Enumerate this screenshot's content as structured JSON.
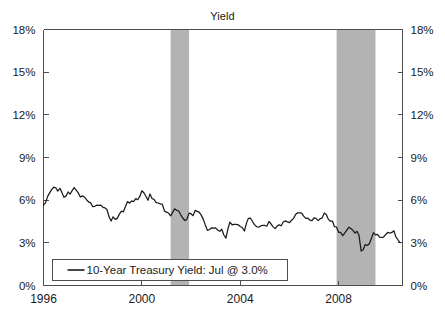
{
  "chart_data": {
    "type": "line",
    "title": "Yield",
    "xlabel": "",
    "ylabel": "",
    "ylim": [
      0,
      18
    ],
    "xlim": [
      1996.0,
      2010.6
    ],
    "y_ticks": [
      0,
      3,
      6,
      9,
      12,
      15,
      18
    ],
    "y_tick_labels": [
      "0%",
      "3%",
      "6%",
      "9%",
      "12%",
      "15%",
      "18%"
    ],
    "x_ticks": [
      1996,
      2000,
      2004,
      2008
    ],
    "x_tick_labels": [
      "1996",
      "2000",
      "2004",
      "2008"
    ],
    "grid": false,
    "dual_axis": true,
    "legend_position": "inside-bottom-left",
    "legend": [
      {
        "label": "10-Year Treasury Yield: Jul @ 3.0%",
        "color": "#1a1a1a",
        "marker": "line"
      }
    ],
    "series": [
      {
        "name": "10-Year Treasury Yield",
        "color": "#1a1a1a",
        "units": "percent",
        "frequency": "monthly",
        "x": [
          1996.0,
          1996.08,
          1996.17,
          1996.25,
          1996.33,
          1996.42,
          1996.5,
          1996.58,
          1996.67,
          1996.75,
          1996.83,
          1996.92,
          1997.0,
          1997.08,
          1997.17,
          1997.25,
          1997.33,
          1997.42,
          1997.5,
          1997.58,
          1997.67,
          1997.75,
          1997.83,
          1997.92,
          1998.0,
          1998.08,
          1998.17,
          1998.25,
          1998.33,
          1998.42,
          1998.5,
          1998.58,
          1998.67,
          1998.75,
          1998.83,
          1998.92,
          1999.0,
          1999.08,
          1999.17,
          1999.25,
          1999.33,
          1999.42,
          1999.5,
          1999.58,
          1999.67,
          1999.75,
          1999.83,
          1999.92,
          2000.0,
          2000.08,
          2000.17,
          2000.25,
          2000.33,
          2000.42,
          2000.5,
          2000.58,
          2000.67,
          2000.75,
          2000.83,
          2000.92,
          2001.0,
          2001.08,
          2001.17,
          2001.25,
          2001.33,
          2001.42,
          2001.5,
          2001.58,
          2001.67,
          2001.75,
          2001.83,
          2001.92,
          2002.0,
          2002.08,
          2002.17,
          2002.25,
          2002.33,
          2002.42,
          2002.5,
          2002.58,
          2002.67,
          2002.75,
          2002.83,
          2002.92,
          2003.0,
          2003.08,
          2003.17,
          2003.25,
          2003.33,
          2003.42,
          2003.5,
          2003.58,
          2003.67,
          2003.75,
          2003.83,
          2003.92,
          2004.0,
          2004.08,
          2004.17,
          2004.25,
          2004.33,
          2004.42,
          2004.5,
          2004.58,
          2004.67,
          2004.75,
          2004.83,
          2004.92,
          2005.0,
          2005.08,
          2005.17,
          2005.25,
          2005.33,
          2005.42,
          2005.5,
          2005.58,
          2005.67,
          2005.75,
          2005.83,
          2005.92,
          2006.0,
          2006.08,
          2006.17,
          2006.25,
          2006.33,
          2006.42,
          2006.5,
          2006.58,
          2006.67,
          2006.75,
          2006.83,
          2006.92,
          2007.0,
          2007.08,
          2007.17,
          2007.25,
          2007.33,
          2007.42,
          2007.5,
          2007.58,
          2007.67,
          2007.75,
          2007.83,
          2007.92,
          2008.0,
          2008.08,
          2008.17,
          2008.25,
          2008.33,
          2008.42,
          2008.5,
          2008.58,
          2008.67,
          2008.75,
          2008.83,
          2008.92,
          2009.0,
          2009.08,
          2009.17,
          2009.25,
          2009.33,
          2009.42,
          2009.5,
          2009.58,
          2009.67,
          2009.75,
          2009.83,
          2009.92,
          2010.0,
          2010.08,
          2010.17,
          2010.25,
          2010.33,
          2010.42,
          2010.5
        ],
        "values": [
          5.65,
          5.81,
          6.27,
          6.51,
          6.74,
          6.91,
          6.87,
          6.64,
          6.83,
          6.53,
          6.2,
          6.3,
          6.58,
          6.42,
          6.69,
          6.89,
          6.71,
          6.49,
          6.22,
          6.3,
          6.21,
          6.03,
          5.88,
          5.81,
          5.54,
          5.57,
          5.65,
          5.64,
          5.65,
          5.5,
          5.46,
          5.34,
          4.81,
          4.53,
          4.83,
          4.65,
          4.72,
          5.0,
          5.23,
          5.18,
          5.54,
          5.9,
          5.79,
          5.94,
          5.92,
          6.11,
          6.03,
          6.28,
          6.66,
          6.52,
          6.26,
          5.99,
          6.44,
          6.1,
          6.05,
          5.83,
          5.8,
          5.74,
          5.72,
          5.24,
          5.16,
          5.1,
          4.89,
          5.14,
          5.39,
          5.28,
          5.24,
          4.97,
          4.73,
          4.57,
          4.65,
          5.09,
          5.04,
          4.91,
          5.28,
          5.21,
          5.16,
          4.93,
          4.65,
          4.26,
          3.87,
          3.94,
          4.05,
          4.03,
          4.05,
          3.9,
          3.81,
          3.96,
          3.57,
          3.33,
          3.98,
          4.45,
          4.27,
          4.29,
          4.3,
          4.27,
          4.15,
          4.08,
          3.83,
          4.35,
          4.72,
          4.73,
          4.5,
          4.28,
          4.13,
          4.1,
          4.19,
          4.23,
          4.22,
          4.17,
          4.5,
          4.34,
          4.14,
          4.0,
          4.18,
          4.26,
          4.2,
          4.46,
          4.54,
          4.47,
          4.42,
          4.57,
          4.72,
          4.99,
          5.11,
          5.11,
          5.09,
          4.88,
          4.72,
          4.73,
          4.6,
          4.56,
          4.76,
          4.72,
          4.56,
          4.69,
          4.75,
          5.1,
          5.0,
          4.67,
          4.52,
          4.53,
          4.15,
          4.1,
          3.74,
          3.74,
          3.51,
          3.68,
          3.88,
          4.1,
          4.01,
          3.89,
          3.69,
          3.81,
          3.53,
          2.42,
          2.52,
          2.87,
          2.82,
          2.93,
          3.29,
          3.72,
          3.56,
          3.59,
          3.4,
          3.39,
          3.4,
          3.59,
          3.73,
          3.69,
          3.73,
          3.85,
          3.42,
          3.2,
          3.01
        ]
      }
    ],
    "shaded_regions": [
      {
        "label": "recession-2001",
        "x_start": 2001.17,
        "x_end": 2001.92,
        "color": "#b3b3b3"
      },
      {
        "label": "recession-2008",
        "x_start": 2007.92,
        "x_end": 2009.5,
        "color": "#b3b3b3"
      }
    ],
    "colors": {
      "line": "#1a1a1a",
      "axis": "#4d4d4d",
      "recession_band": "#b3b3b3",
      "background": "#ffffff",
      "text": "#1a1a1a"
    }
  }
}
